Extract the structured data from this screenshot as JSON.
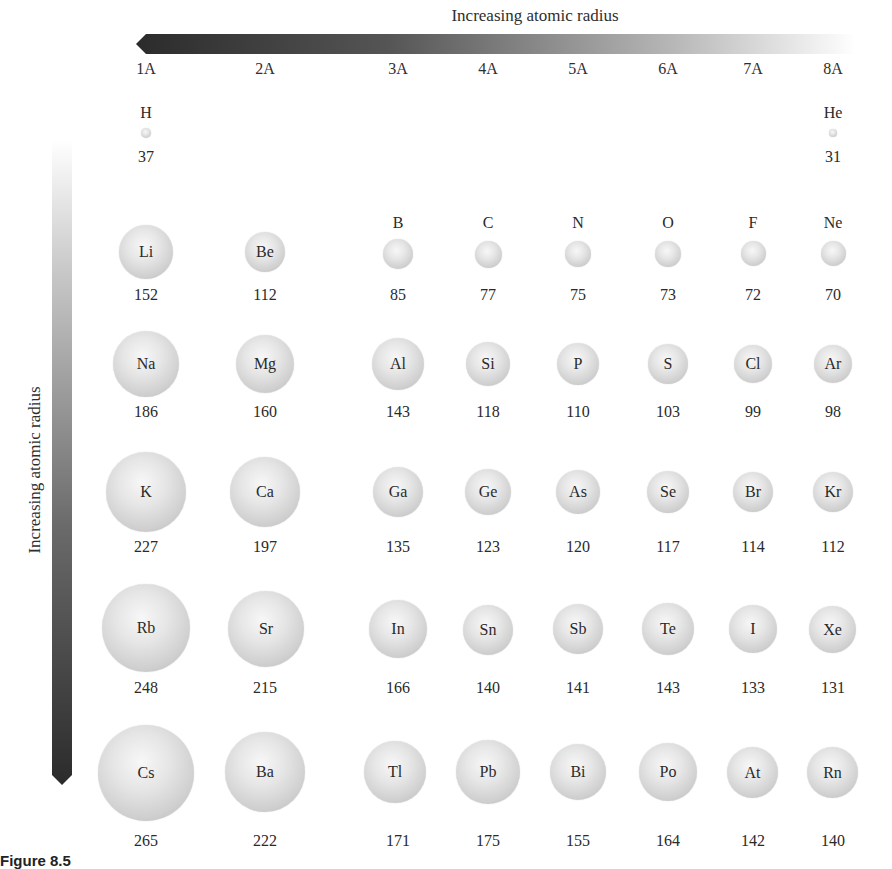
{
  "figure": {
    "top_arrow_label": "Increasing atomic radius",
    "side_arrow_label": "Increasing atomic radius",
    "caption_visible": "Figure 8.5",
    "groups": [
      "1A",
      "2A",
      "3A",
      "4A",
      "5A",
      "6A",
      "7A",
      "8A"
    ]
  },
  "elements": {
    "H": {
      "symbol": "H",
      "radius": "37"
    },
    "He": {
      "symbol": "He",
      "radius": "31"
    },
    "Li": {
      "symbol": "Li",
      "radius": "152"
    },
    "Be": {
      "symbol": "Be",
      "radius": "112"
    },
    "B": {
      "symbol": "B",
      "radius": "85"
    },
    "C": {
      "symbol": "C",
      "radius": "77"
    },
    "N": {
      "symbol": "N",
      "radius": "75"
    },
    "O": {
      "symbol": "O",
      "radius": "73"
    },
    "F": {
      "symbol": "F",
      "radius": "72"
    },
    "Ne": {
      "symbol": "Ne",
      "radius": "70"
    },
    "Na": {
      "symbol": "Na",
      "radius": "186"
    },
    "Mg": {
      "symbol": "Mg",
      "radius": "160"
    },
    "Al": {
      "symbol": "Al",
      "radius": "143"
    },
    "Si": {
      "symbol": "Si",
      "radius": "118"
    },
    "P": {
      "symbol": "P",
      "radius": "110"
    },
    "S": {
      "symbol": "S",
      "radius": "103"
    },
    "Cl": {
      "symbol": "Cl",
      "radius": "99"
    },
    "Ar": {
      "symbol": "Ar",
      "radius": "98"
    },
    "K": {
      "symbol": "K",
      "radius": "227"
    },
    "Ca": {
      "symbol": "Ca",
      "radius": "197"
    },
    "Ga": {
      "symbol": "Ga",
      "radius": "135"
    },
    "Ge": {
      "symbol": "Ge",
      "radius": "123"
    },
    "As": {
      "symbol": "As",
      "radius": "120"
    },
    "Se": {
      "symbol": "Se",
      "radius": "117"
    },
    "Br": {
      "symbol": "Br",
      "radius": "114"
    },
    "Kr": {
      "symbol": "Kr",
      "radius": "112"
    },
    "Rb": {
      "symbol": "Rb",
      "radius": "248"
    },
    "Sr": {
      "symbol": "Sr",
      "radius": "215"
    },
    "In": {
      "symbol": "In",
      "radius": "166"
    },
    "Sn": {
      "symbol": "Sn",
      "radius": "140"
    },
    "Sb": {
      "symbol": "Sb",
      "radius": "141"
    },
    "Te": {
      "symbol": "Te",
      "radius": "143"
    },
    "I": {
      "symbol": "I",
      "radius": "133"
    },
    "Xe": {
      "symbol": "Xe",
      "radius": "131"
    },
    "Cs": {
      "symbol": "Cs",
      "radius": "265"
    },
    "Ba": {
      "symbol": "Ba",
      "radius": "222"
    },
    "Tl": {
      "symbol": "Tl",
      "radius": "171"
    },
    "Pb": {
      "symbol": "Pb",
      "radius": "175"
    },
    "Bi": {
      "symbol": "Bi",
      "radius": "155"
    },
    "Po": {
      "symbol": "Po",
      "radius": "164"
    },
    "At": {
      "symbol": "At",
      "radius": "142"
    },
    "Rn": {
      "symbol": "Rn",
      "radius": "140"
    }
  },
  "colors": {
    "arrow_dark": "#2b2b2b",
    "arrow_light": "#f2f2f2",
    "sphere_light": "#f7f7f7",
    "sphere_dark": "#b5b5b5"
  }
}
